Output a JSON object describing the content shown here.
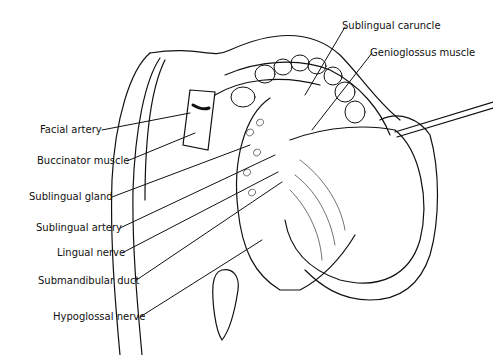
{
  "figure": {
    "type": "anatomical illustration"
  },
  "labels_left": [
    {
      "text": "Facial artery",
      "x": 40,
      "y": 124,
      "tx": 190,
      "ty": 113
    },
    {
      "text": "Buccinator muscle",
      "x": 37,
      "y": 155,
      "tx": 195,
      "ty": 133
    },
    {
      "text": "Sublingual gland",
      "x": 29,
      "y": 191,
      "tx": 250,
      "ty": 145
    },
    {
      "text": "Sublingual artery",
      "x": 36,
      "y": 222,
      "tx": 275,
      "ty": 155
    },
    {
      "text": "Lingual nerve",
      "x": 57,
      "y": 247,
      "tx": 278,
      "ty": 172
    },
    {
      "text": "Submandibular duct",
      "x": 38,
      "y": 275,
      "tx": 282,
      "ty": 182
    },
    {
      "text": "Hypoglossal nerve",
      "x": 53,
      "y": 311,
      "tx": 262,
      "ty": 240
    }
  ],
  "labels_right": [
    {
      "text": "Sublingual caruncle",
      "x": 342,
      "y": 20,
      "tx": 310,
      "ty": 92
    },
    {
      "text": "Genioglossus muscle",
      "x": 370,
      "y": 47,
      "tx": 312,
      "ty": 130
    }
  ]
}
